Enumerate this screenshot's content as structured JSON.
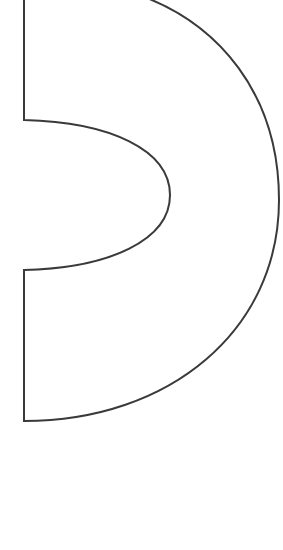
{
  "figure": {
    "background_color": "#ffffff",
    "fill_color": "#ffffff",
    "stroke_color": "#3a3a3a",
    "stroke_width": 2,
    "outline": {
      "left_edge_x": 24,
      "top_start": [
        147,
        0
      ],
      "outer_right_extreme": [
        279,
        195
      ],
      "bottom_corner": [
        24,
        421
      ],
      "inner_notch_top": [
        24,
        120
      ],
      "inner_notch_tip": [
        170,
        195
      ],
      "inner_notch_bottom": [
        24,
        270
      ]
    }
  }
}
